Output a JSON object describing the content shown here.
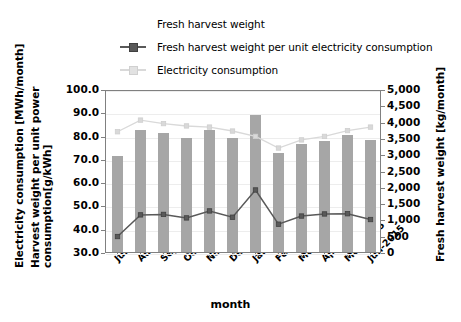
{
  "chart_data": {
    "type": "bar",
    "title": "",
    "xlabel": "month",
    "ylabel_left": "Electricity consumption [MWh/month] Harvest weight per unit power consumption[g/kWh]",
    "ylabel_right": "Fresh harvest weight [kg/month]",
    "categories": [
      "Jul-2014",
      "Aug-2014",
      "Sep-2014",
      "Oct-2014",
      "Nov-2014",
      "Dec-2014",
      "Jan-2015",
      "Feb-2015",
      "Mar-2015",
      "Apr-2015",
      "May-2015",
      "Jun-2015"
    ],
    "ylim_left": [
      30.0,
      100.0
    ],
    "ylim_right": [
      0,
      5000
    ],
    "ytick_left": [
      "100.0",
      "90.0",
      "80.0",
      "70.0",
      "60.0",
      "50.0",
      "40.0",
      "30.0"
    ],
    "ytick_right": [
      "5,000",
      "4,500",
      "4,000",
      "3,500",
      "3,000",
      "2,500",
      "2,000",
      "1,500",
      "1,000",
      "500",
      "0"
    ],
    "grid": true,
    "legend_position": "top",
    "series": [
      {
        "name": "Fresh harvest weight",
        "type": "bar",
        "axis": "right",
        "unit": "kg/month",
        "color": "#a6a6a6",
        "values": [
          2950,
          3750,
          3650,
          3500,
          3750,
          3500,
          4200,
          3050,
          3300,
          3400,
          3600,
          3450
        ]
      },
      {
        "name": "Fresh harvest weight per unit electricity consumption",
        "type": "line",
        "axis": "left",
        "unit": "g/kWh",
        "color": "#595959",
        "values": [
          37.5,
          46.8,
          47.0,
          45.5,
          48.5,
          45.8,
          57.5,
          42.8,
          46.3,
          47.2,
          47.3,
          44.8
        ]
      },
      {
        "name": "Electricity consumption",
        "type": "line",
        "axis": "left",
        "unit": "MWh/month",
        "color": "#d9d9d9",
        "values": [
          82.5,
          87.5,
          86.0,
          85.0,
          84.5,
          82.8,
          80.5,
          75.5,
          79.0,
          80.5,
          83.0,
          84.5
        ]
      }
    ]
  },
  "legend": {
    "items": [
      {
        "label": "Fresh harvest weight",
        "key": "bar-swatch"
      },
      {
        "label": "Fresh harvest weight per unit electricity consumption",
        "key": "line-marker-dark"
      },
      {
        "label": "Electricity consumption",
        "key": "line-light"
      }
    ]
  },
  "axis_titles": {
    "left_line1": "Electricity consumption [MWh/month]",
    "left_line2a": "Harvest weight per unit power",
    "left_line2b": "consumption[g/kWh]",
    "right": "Fresh harvest weight [kg/month]",
    "bottom": "month"
  }
}
